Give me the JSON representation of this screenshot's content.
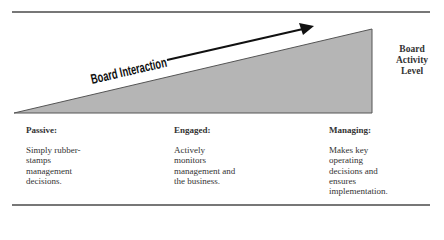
{
  "diagram": {
    "arrow_label": "Board Interaction",
    "axis_label": "Board\nActivity\nLevel",
    "colors": {
      "wedge_fill": "#b5b5b5",
      "wedge_stroke": "#555555",
      "arrow": "#111111",
      "rule": "#777777"
    },
    "columns": [
      {
        "title": "Passive:",
        "description": "Simply rubber-\nstamps\nmanagement\ndecisions."
      },
      {
        "title": "Engaged:",
        "description": "Actively\nmonitors\nmanagement and\nthe business."
      },
      {
        "title": "Managing:",
        "description": "Makes key\noperating\ndecisions and\nensures\nimplementation."
      }
    ]
  }
}
